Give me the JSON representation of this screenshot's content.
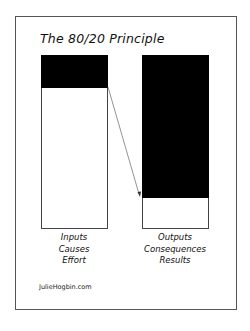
{
  "title": "The 80/20 Principle",
  "colors": {
    "fill": "#000000",
    "background": "#ffffff",
    "border": "#444444"
  },
  "left_bar": {
    "filled_fraction": 0.2,
    "labels": [
      "Inputs",
      "Causes",
      "Effort"
    ]
  },
  "right_bar": {
    "filled_fraction": 0.8,
    "labels": [
      "Outputs",
      "Consequences",
      "Results"
    ]
  },
  "arrow": {
    "from": "left-bar-divider",
    "to": "right-bar-divider"
  },
  "credit": "JulieHogbin.com"
}
